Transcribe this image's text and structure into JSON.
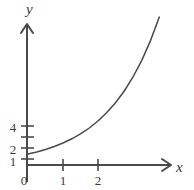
{
  "figure": {
    "name": "exponential-growth-graph",
    "background_color": "#ffffff",
    "axis_color": "#4a4a4a",
    "curve_color": "#4a4a4a",
    "text_color": "#3a3a3a"
  },
  "axes": {
    "x_axis_label": "x",
    "y_axis_label": "y",
    "origin_label": "0"
  },
  "chart_data": {
    "type": "line",
    "title": "",
    "xlabel": "x",
    "ylabel": "y",
    "grid": false,
    "legend": "none",
    "xlim": [
      0,
      4.1
    ],
    "ylim": [
      0,
      15
    ],
    "x_ticks": [
      1,
      2
    ],
    "x_tick_labels": [
      "1",
      "2"
    ],
    "y_ticks": [
      1,
      2,
      3,
      4
    ],
    "y_tick_labels": [
      "1",
      "2",
      "",
      "4"
    ],
    "origin_tick_label": "0",
    "series": [
      {
        "name": "exponential curve",
        "x": [
          0,
          0.25,
          0.5,
          0.75,
          1,
          1.25,
          1.5,
          1.75,
          2,
          2.25,
          2.5,
          2.75,
          3,
          3.25,
          3.5,
          3.75,
          3.95
        ],
        "y": [
          1,
          1.19,
          1.41,
          1.68,
          2,
          2.38,
          2.83,
          3.36,
          4,
          4.76,
          5.66,
          6.73,
          8,
          9.51,
          11.31,
          13.45,
          15.0
        ]
      }
    ]
  }
}
